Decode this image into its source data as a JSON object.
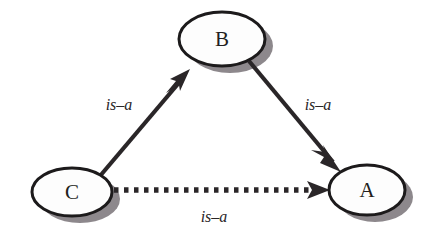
{
  "diagram": {
    "type": "directed-graph",
    "background_color": "#ffffff",
    "node_fill_color": "#fdfdfd",
    "node_stroke_color": "#1c1a1b",
    "node_shadow_color": "#8a8589",
    "edge_color": "#2a2628",
    "nodes": [
      {
        "id": "B",
        "label": "B",
        "cx": 222,
        "cy": 39,
        "rx": 43,
        "ry": 27
      },
      {
        "id": "C",
        "label": "C",
        "cx": 72,
        "cy": 192,
        "rx": 40,
        "ry": 24
      },
      {
        "id": "A",
        "label": "A",
        "cx": 367,
        "cy": 190,
        "rx": 38,
        "ry": 25
      }
    ],
    "edges": [
      {
        "id": "c-to-b",
        "from": "C",
        "to": "B",
        "label": "is–a",
        "style": "solid",
        "arrowhead": "barbed",
        "label_x": 119,
        "label_y": 104
      },
      {
        "id": "b-to-a",
        "from": "B",
        "to": "A",
        "label": "is–a",
        "style": "solid",
        "arrowhead": "barbed",
        "label_x": 318,
        "label_y": 104
      },
      {
        "id": "c-to-a",
        "from": "C",
        "to": "A",
        "label": "is–a",
        "style": "dotted",
        "arrowhead": "barbed",
        "label_x": 214,
        "label_y": 216
      }
    ]
  }
}
